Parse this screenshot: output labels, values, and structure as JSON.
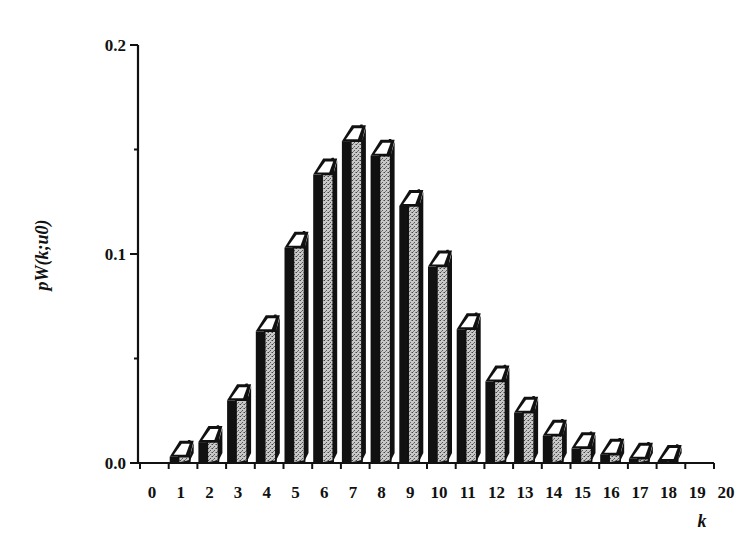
{
  "chart_data": {
    "type": "bar",
    "style": "3d-bar",
    "title": "",
    "xlabel": "k",
    "ylabel": "pW(k;u0)",
    "categories": [
      "0",
      "1",
      "2",
      "3",
      "4",
      "5",
      "6",
      "7",
      "8",
      "9",
      "10",
      "11",
      "12",
      "13",
      "14",
      "15",
      "16",
      "17",
      "18",
      "19",
      "20"
    ],
    "values": [
      0.0,
      0.003,
      0.01,
      0.03,
      0.063,
      0.103,
      0.138,
      0.154,
      0.147,
      0.123,
      0.094,
      0.064,
      0.039,
      0.024,
      0.013,
      0.007,
      0.004,
      0.002,
      0.001,
      0.0,
      0.0
    ],
    "ylim": [
      0.0,
      0.2
    ],
    "yticks": [
      "0.0",
      "0.1",
      "0.2"
    ],
    "yticks_minor": [
      0.05,
      0.15
    ],
    "grid": false,
    "legend": null
  },
  "colors": {
    "axis": "#111111",
    "bar_front": "#111111",
    "bar_side": "#b8b8b8",
    "bar_top": "#ffffff"
  }
}
